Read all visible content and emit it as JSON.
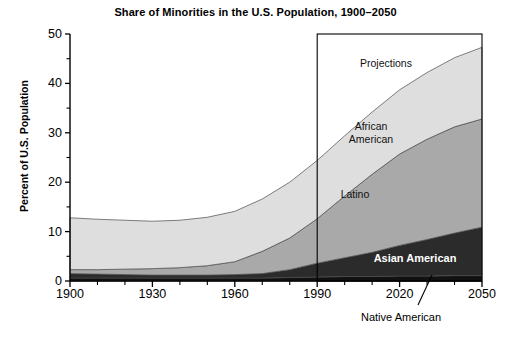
{
  "chart_data": {
    "type": "area",
    "title": "Share of Minorities in the U.S. Population, 1900–2050",
    "xlabel": "",
    "ylabel": "Percent of U.S. Population",
    "xlim": [
      1900,
      2050
    ],
    "ylim": [
      0,
      50
    ],
    "grid": false,
    "legend_position": "inline-annotations",
    "stacked": true,
    "x": [
      1900,
      1910,
      1920,
      1930,
      1940,
      1950,
      1960,
      1970,
      1980,
      1990,
      2000,
      2010,
      2020,
      2030,
      2040,
      2050
    ],
    "xticks": [
      "1900",
      "1930",
      "1960",
      "1990",
      "2020",
      "2050"
    ],
    "yticks": [
      "0",
      "10",
      "20",
      "30",
      "40",
      "50"
    ],
    "yticks_minor": [
      5,
      15,
      25,
      35,
      45
    ],
    "series": [
      {
        "name": "Native American",
        "color": "#111111",
        "values": [
          0.6,
          0.6,
          0.6,
          0.6,
          0.6,
          0.6,
          0.6,
          0.6,
          0.7,
          0.8,
          0.9,
          0.9,
          1.0,
          1.0,
          1.1,
          1.1
        ]
      },
      {
        "name": "Asian American",
        "color": "#2b2b2b",
        "values": [
          0.9,
          0.8,
          0.7,
          0.6,
          0.6,
          0.6,
          0.7,
          0.9,
          1.6,
          2.8,
          3.8,
          4.9,
          6.2,
          7.4,
          8.6,
          9.8
        ]
      },
      {
        "name": "Latino",
        "color": "#a9a9a9",
        "values": [
          0.8,
          0.9,
          1.1,
          1.3,
          1.5,
          1.9,
          2.6,
          4.5,
          6.4,
          9.0,
          12.5,
          15.8,
          18.5,
          20.3,
          21.5,
          21.9
        ]
      },
      {
        "name": "African American",
        "color": "#dedede",
        "values": [
          10.5,
          10.2,
          9.9,
          9.6,
          9.6,
          9.8,
          10.2,
          10.6,
          11.3,
          11.8,
          12.2,
          12.6,
          13.0,
          13.5,
          14.0,
          14.5
        ]
      }
    ],
    "totals": [
      12.8,
      12.5,
      12.3,
      12.1,
      12.3,
      12.9,
      14.1,
      16.6,
      20.0,
      24.4,
      29.4,
      34.2,
      38.7,
      42.2,
      45.2,
      47.3
    ],
    "annotations": [
      {
        "id": "projections",
        "text": "Projections",
        "x": 2005,
        "y": 42
      },
      {
        "id": "african-american",
        "text": "African\nAmerican",
        "x": 2010,
        "y": 29
      },
      {
        "id": "latino",
        "text": "Latino",
        "x": 2008,
        "y": 17
      },
      {
        "id": "asian-american",
        "text": "Asian American",
        "x": 2016,
        "y": 5
      },
      {
        "id": "native-american",
        "text": "Native American",
        "x": 2036,
        "y": -7
      }
    ],
    "projection_box": {
      "from": 1990,
      "to": 2050,
      "top": 50,
      "bottom": 0,
      "label": "Projections"
    }
  }
}
